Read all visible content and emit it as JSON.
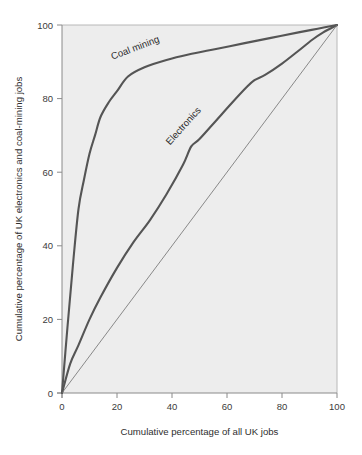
{
  "chart_data": {
    "type": "line",
    "title": "",
    "subtitle": "",
    "xlabel": "Cumulative percentage of all UK jobs",
    "ylabel": "Cumulative percentage of UK electronics and coal-mining jobs",
    "xlim": [
      0,
      100
    ],
    "ylim": [
      0,
      100
    ],
    "xticks": [
      "0",
      "20",
      "40",
      "60",
      "80",
      "100"
    ],
    "yticks": [
      "0",
      "20",
      "40",
      "60",
      "80",
      "100"
    ],
    "xtick_values": [
      0,
      20,
      40,
      60,
      80,
      100
    ],
    "ytick_values": [
      0,
      20,
      40,
      60,
      80,
      100
    ],
    "grid": false,
    "legend": "inline-annotations",
    "plot_background": "#ededed",
    "line_color": "#555555",
    "reference_line_color": "#6e6e6e",
    "axis_color": "#8a8a8a",
    "series": [
      {
        "name": "Coal mining",
        "annotation": "Coal mining",
        "annotation_rotation": -21,
        "annotation_x": 27,
        "annotation_y": 93,
        "color": "#555555",
        "width": 2.1,
        "x": [
          0,
          2,
          4,
          6,
          8,
          10,
          12,
          14,
          17,
          20,
          24,
          30,
          38,
          46,
          56,
          66,
          76,
          86,
          93,
          100
        ],
        "y": [
          0,
          18,
          35,
          50,
          58,
          65,
          70,
          75,
          79,
          82,
          86,
          88.5,
          90.5,
          92,
          93.5,
          95,
          96.5,
          98,
          99,
          100
        ]
      },
      {
        "name": "Electronics",
        "annotation": "Electronics",
        "annotation_rotation": -48,
        "annotation_x": 45,
        "annotation_y": 72,
        "color": "#555555",
        "width": 2.1,
        "x": [
          0,
          3,
          6,
          10,
          14,
          20,
          26,
          32,
          38,
          44,
          47,
          50,
          56,
          62,
          67,
          70,
          74,
          80,
          86,
          91,
          95,
          100
        ],
        "y": [
          0,
          8,
          13,
          20,
          26,
          34,
          41,
          47,
          54,
          62,
          67,
          69,
          74,
          79,
          83,
          85,
          86.5,
          89.5,
          93,
          96,
          98,
          100
        ]
      },
      {
        "name": "Line of equality",
        "annotation": "",
        "color": "#6e6e6e",
        "width": 0.8,
        "x": [
          0,
          100
        ],
        "y": [
          0,
          100
        ]
      }
    ]
  },
  "geometry": {
    "plot_left": 62,
    "plot_right": 337,
    "plot_top": 25,
    "plot_bottom": 393
  }
}
